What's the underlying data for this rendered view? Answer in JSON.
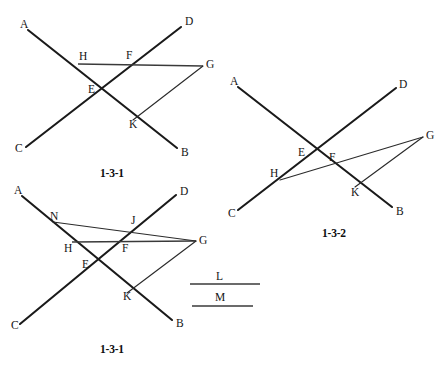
{
  "page": {
    "width": 444,
    "height": 368,
    "background": "#ffffff",
    "ink_color": "#1a1a1a"
  },
  "figures": [
    {
      "id": "figure-1",
      "caption": "1-3-1",
      "caption_pos": {
        "x": 100,
        "y": 168
      },
      "points": [
        {
          "name": "A",
          "label": "A",
          "x": 28,
          "y": 30,
          "label_x": 20,
          "label_y": 19
        },
        {
          "name": "B",
          "label": "B",
          "x": 177,
          "y": 148,
          "label_x": 181,
          "label_y": 147
        },
        {
          "name": "C",
          "label": "C",
          "x": 26,
          "y": 147,
          "label_x": 15,
          "label_y": 143
        },
        {
          "name": "D",
          "label": "D",
          "x": 181,
          "y": 27,
          "label_x": 185,
          "label_y": 16
        },
        {
          "name": "E",
          "label": "E",
          "x": 101,
          "y": 91,
          "label_x": 88,
          "label_y": 84
        },
        {
          "name": "F",
          "label": "F",
          "x": 130,
          "y": 64,
          "label_x": 126,
          "label_y": 50
        },
        {
          "name": "G",
          "label": "G",
          "x": 203,
          "y": 66,
          "label_x": 206,
          "label_y": 59
        },
        {
          "name": "H",
          "label": "H",
          "x": 78,
          "y": 64,
          "label_x": 79,
          "label_y": 51
        },
        {
          "name": "K",
          "label": "K",
          "x": 133,
          "y": 120,
          "label_x": 129,
          "label_y": 119
        }
      ],
      "lines": [
        {
          "name": "line-AB",
          "from": "A",
          "to": "B",
          "weight": "main"
        },
        {
          "name": "line-CD",
          "from": "C",
          "to": "D",
          "weight": "main"
        },
        {
          "name": "line-HG",
          "from": "H",
          "to": "G",
          "weight": "seg"
        },
        {
          "name": "line-KG",
          "from": "K",
          "to": "G",
          "weight": "thin"
        }
      ]
    },
    {
      "id": "figure-2",
      "caption": "1-3-2",
      "caption_pos": {
        "x": 322,
        "y": 228
      },
      "points": [
        {
          "name": "A",
          "label": "A",
          "x": 238,
          "y": 87,
          "label_x": 230,
          "label_y": 76
        },
        {
          "name": "B",
          "label": "B",
          "x": 392,
          "y": 207,
          "label_x": 396,
          "label_y": 206
        },
        {
          "name": "C",
          "label": "C",
          "x": 238,
          "y": 210,
          "label_x": 228,
          "label_y": 208
        },
        {
          "name": "D",
          "label": "D",
          "x": 396,
          "y": 88,
          "label_x": 399,
          "label_y": 79
        },
        {
          "name": "E",
          "label": "E",
          "x": 310,
          "y": 152,
          "label_x": 298,
          "label_y": 147
        },
        {
          "name": "F",
          "label": "F",
          "x": 330,
          "y": 160,
          "label_x": 329,
          "label_y": 152
        },
        {
          "name": "G",
          "label": "G",
          "x": 423,
          "y": 137,
          "label_x": 426,
          "label_y": 130
        },
        {
          "name": "H",
          "label": "H",
          "x": 280,
          "y": 180,
          "label_x": 270,
          "label_y": 168
        },
        {
          "name": "K",
          "label": "K",
          "x": 355,
          "y": 187,
          "label_x": 351,
          "label_y": 187
        }
      ],
      "lines": [
        {
          "name": "line-AB",
          "from": "A",
          "to": "B",
          "weight": "main"
        },
        {
          "name": "line-CD",
          "from": "C",
          "to": "D",
          "weight": "main"
        },
        {
          "name": "line-HG",
          "from": "H",
          "to": "G",
          "weight": "thin"
        },
        {
          "name": "line-KG",
          "from": "K",
          "to": "G",
          "weight": "thin"
        }
      ]
    },
    {
      "id": "figure-3",
      "caption": "1-3-1",
      "caption_pos": {
        "x": 100,
        "y": 344
      },
      "points": [
        {
          "name": "A",
          "label": "A",
          "x": 22,
          "y": 196,
          "label_x": 14,
          "label_y": 185
        },
        {
          "name": "B",
          "label": "B",
          "x": 172,
          "y": 320,
          "label_x": 176,
          "label_y": 318
        },
        {
          "name": "C",
          "label": "C",
          "x": 20,
          "y": 324,
          "label_x": 11,
          "label_y": 320
        },
        {
          "name": "D",
          "label": "D",
          "x": 176,
          "y": 195,
          "label_x": 180,
          "label_y": 186
        },
        {
          "name": "E",
          "label": "E",
          "x": 94,
          "y": 266,
          "label_x": 82,
          "label_y": 259
        },
        {
          "name": "F",
          "label": "F",
          "x": 126,
          "y": 243,
          "label_x": 122,
          "label_y": 243
        },
        {
          "name": "G",
          "label": "G",
          "x": 196,
          "y": 241,
          "label_x": 199,
          "label_y": 235
        },
        {
          "name": "H",
          "label": "H",
          "x": 72,
          "y": 242,
          "label_x": 64,
          "label_y": 243
        },
        {
          "name": "J",
          "label": "J",
          "x": 133,
          "y": 227,
          "label_x": 131,
          "label_y": 215
        },
        {
          "name": "K",
          "label": "K",
          "x": 127,
          "y": 293,
          "label_x": 123,
          "label_y": 291
        },
        {
          "name": "N",
          "label": "N",
          "x": 53,
          "y": 222,
          "label_x": 50,
          "label_y": 211
        }
      ],
      "lines": [
        {
          "name": "line-AB",
          "from": "A",
          "to": "B",
          "weight": "main"
        },
        {
          "name": "line-CD",
          "from": "C",
          "to": "D",
          "weight": "main"
        },
        {
          "name": "line-HG",
          "from": "H",
          "to": "G",
          "weight": "seg"
        },
        {
          "name": "line-NG",
          "from": "N",
          "to": "G",
          "weight": "thin"
        },
        {
          "name": "line-KG",
          "from": "K",
          "to": "G",
          "weight": "thin"
        }
      ]
    }
  ],
  "measure_segments": [
    {
      "name": "segment-L",
      "label": "L",
      "x1": 190,
      "y1": 284,
      "x2": 260,
      "y2": 284,
      "label_x": 216,
      "label_y": 271
    },
    {
      "name": "segment-M",
      "label": "M",
      "x1": 192,
      "y1": 306,
      "x2": 253,
      "y2": 306,
      "label_x": 215,
      "label_y": 292
    }
  ]
}
